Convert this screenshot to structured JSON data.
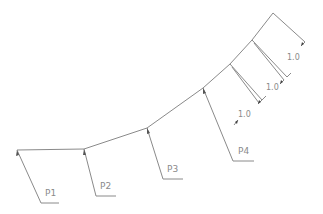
{
  "diagram": {
    "type": "cad-polyline-with-point-labels",
    "line_color": "#8a8a8a",
    "background": "#ffffff",
    "polyline": [
      [
        17,
        150
      ],
      [
        84,
        149
      ],
      [
        147,
        128
      ],
      [
        203,
        88
      ],
      [
        230,
        64
      ],
      [
        252,
        40
      ],
      [
        273,
        13
      ]
    ],
    "points": [
      {
        "label": "P1",
        "at": [
          17,
          150
        ],
        "leader_end": [
          41,
          203
        ],
        "shelf_end": [
          59,
          203
        ],
        "text_pos": [
          45,
          196
        ]
      },
      {
        "label": "P2",
        "at": [
          84,
          149
        ],
        "leader_end": [
          96,
          196
        ],
        "shelf_end": [
          116,
          196
        ],
        "text_pos": [
          100,
          189
        ]
      },
      {
        "label": "P3",
        "at": [
          147,
          128
        ],
        "leader_end": [
          163,
          179
        ],
        "shelf_end": [
          183,
          179
        ],
        "text_pos": [
          167,
          172
        ]
      },
      {
        "label": "P4",
        "at": [
          203,
          88
        ],
        "leader_end": [
          233,
          161
        ],
        "shelf_end": [
          254,
          161
        ],
        "text_pos": [
          238,
          154
        ]
      }
    ],
    "dimensions": [
      {
        "label": "1.0",
        "text_pos": [
          243,
          115
        ]
      },
      {
        "label": "1.0",
        "text_pos": [
          272,
          88
        ]
      },
      {
        "label": "1.0",
        "text_pos": [
          292,
          58
        ]
      }
    ]
  }
}
